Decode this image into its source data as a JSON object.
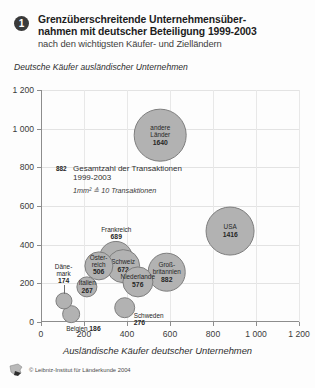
{
  "header": {
    "badge": "1",
    "title_line1": "Grenzüberschreitende Unternehmensüber-",
    "title_line2": "nahmen mit deutscher Beteiligung 1999-2003",
    "subtitle": "nach den wichtigsten Käufer- und Zielländern"
  },
  "legend": {
    "key": "882",
    "text_line1": "Gesamtzahl der Transaktionen",
    "text_line2": "1999-2003",
    "note": "1mm² ≙ 10 Transaktionen"
  },
  "credit": {
    "text": "© Leibniz-Institut für Länderkunde 2004",
    "logo": "ifl-logo-icon"
  },
  "chart_data": {
    "type": "scatter",
    "subtitle": "nach den wichtigsten Käufer- und Zielländern",
    "xlabel": "Ausländische Käufer deutscher Unternehmen",
    "ylabel": "Deutsche Käufer ausländischer Unternehmen",
    "xlim": [
      0,
      1200
    ],
    "ylim": [
      0,
      1200
    ],
    "xticks": [
      0,
      200,
      400,
      600,
      800,
      1000,
      1200
    ],
    "yticks": [
      0,
      200,
      400,
      600,
      800,
      1000,
      1200
    ],
    "grid": true,
    "legend_position": "inside-left",
    "size_note": "1mm² ≙ 10 Transaktionen",
    "points": [
      {
        "label": "andere Länder",
        "label_line1": "andere",
        "label_line2": "Länder",
        "value": 1640,
        "x": 555,
        "y": 965,
        "label_pos": "inside"
      },
      {
        "label": "USA",
        "label_line1": "USA",
        "label_line2": "",
        "value": 1416,
        "x": 880,
        "y": 470,
        "label_pos": "inside"
      },
      {
        "label": "Großbritannien",
        "label_line1": "Groß-",
        "label_line2": "britannien",
        "value": 882,
        "x": 585,
        "y": 258,
        "label_pos": "inside"
      },
      {
        "label": "Frankreich",
        "label_line1": "Frankreich",
        "label_line2": "",
        "value": 689,
        "x": 350,
        "y": 332,
        "label_pos": "above"
      },
      {
        "label": "Schweiz",
        "label_line1": "Schweiz",
        "label_line2": "",
        "value": 672,
        "x": 382,
        "y": 288,
        "label_pos": "inside"
      },
      {
        "label": "Niederlande",
        "label_line1": "Niederlande",
        "label_line2": "",
        "value": 576,
        "x": 450,
        "y": 208,
        "label_pos": "inside"
      },
      {
        "label": "Österreich",
        "label_line1": "Öster-",
        "label_line2": "reich",
        "value": 506,
        "x": 268,
        "y": 291,
        "label_pos": "inside"
      },
      {
        "label": "Schweden",
        "label_line1": "Schweden",
        "label_line2": "",
        "value": 276,
        "x": 390,
        "y": 75,
        "label_pos": "below-right"
      },
      {
        "label": "Italien",
        "label_line1": "Italien",
        "label_line2": "",
        "value": 267,
        "x": 215,
        "y": 180,
        "label_pos": "inside"
      },
      {
        "label": "Belgien",
        "label_line1": "Belgien",
        "label_line2": "",
        "value": 186,
        "x": 140,
        "y": 42,
        "label_pos": "below"
      },
      {
        "label": "Dänemark",
        "label_line1": "Däne-",
        "label_line2": "mark",
        "value": 174,
        "x": 105,
        "y": 108,
        "label_pos": "above-leader"
      }
    ]
  }
}
